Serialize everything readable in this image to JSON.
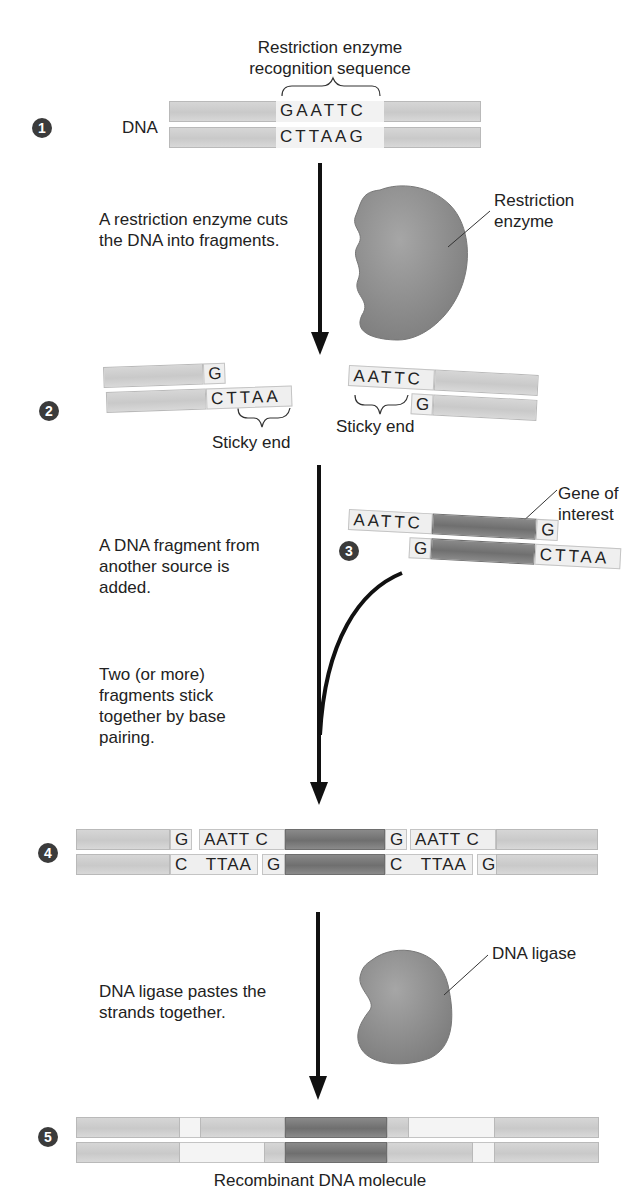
{
  "steps": [
    {
      "number": "1",
      "strand_label": "DNA",
      "annotation": "Restriction enzyme recognition sequence",
      "top_sequence": "GAATTC",
      "bottom_sequence": "CTTAAG"
    },
    {
      "number": "2",
      "left_top": "G",
      "left_bottom": "CTTAA",
      "right_top": "AATTC",
      "right_bottom": "G",
      "left_sticky_label": "Sticky end",
      "right_sticky_label": "Sticky end"
    },
    {
      "number": "3",
      "top_left": "AATTC",
      "top_right": "G",
      "bottom_left": "G",
      "bottom_right": "CTTAA",
      "gene_label": "Gene of interest"
    },
    {
      "number": "4",
      "top_row": [
        "G",
        "AATT C",
        "G",
        "AATT C"
      ],
      "bottom_row": [
        "C",
        "TTAA",
        "G",
        "C",
        "TTAA",
        "G"
      ]
    },
    {
      "number": "5",
      "caption": "Recombinant DNA molecule"
    }
  ],
  "descriptions": {
    "cut": "A restriction enzyme cuts the DNA into fragments.",
    "add": "A DNA fragment from another source is added.",
    "pair": "Two (or more) fragments stick together by base pairing.",
    "ligase": "DNA ligase pastes the strands together."
  },
  "enzymes": {
    "restriction": "Restriction enzyme",
    "ligase": "DNA ligase"
  },
  "colors": {
    "strand": "#cfcfcf",
    "gene": "#7a7a7a",
    "enzyme": "#8c8c8c",
    "arrow": "#111111",
    "badge": "#3b3b3b"
  }
}
